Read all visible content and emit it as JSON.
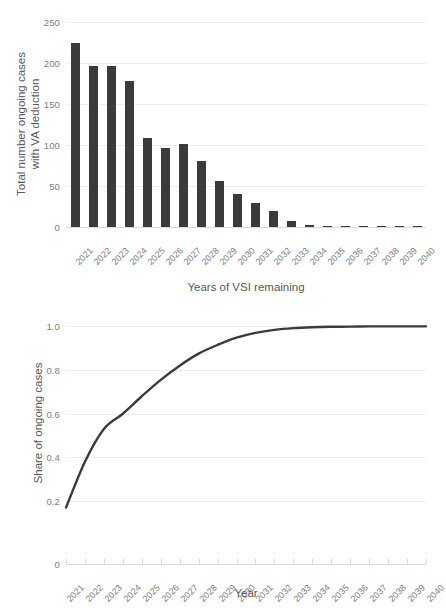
{
  "chart_data": [
    {
      "type": "bar",
      "id": "ongoing-cases-bar",
      "title": "",
      "xlabel": "Years of VSI remaining",
      "ylabel": "Total number ongoing cases with VA deduction",
      "ylabel_lines": [
        "Total number ongoing cases",
        "with VA deduction"
      ],
      "categories": [
        "2021",
        "2022",
        "2023",
        "2024",
        "2025",
        "2026",
        "2027",
        "2028",
        "2029",
        "2030",
        "2031",
        "2032",
        "2033",
        "2034",
        "2035",
        "2036",
        "2037",
        "2038",
        "2039",
        "2040"
      ],
      "values": [
        225,
        196,
        196,
        178,
        109,
        96,
        101,
        80,
        56,
        40,
        29,
        20,
        7,
        3,
        1.5,
        0.6,
        0.6,
        0.6,
        0.6,
        0.6
      ],
      "ylim": [
        0,
        250
      ],
      "yticks": [
        0,
        50,
        100,
        150,
        200,
        250
      ],
      "ytick_labels": [
        "0",
        "50",
        "100",
        "150",
        "200",
        "250"
      ],
      "grid": true,
      "legend": "none",
      "bar_color": "#3b3b3d"
    },
    {
      "type": "line",
      "id": "share-ongoing-cases-line",
      "title": "",
      "xlabel": "Year",
      "ylabel": "Share of ongoing cases",
      "x": [
        "2021",
        "2022",
        "2023",
        "2024",
        "2025",
        "2026",
        "2027",
        "2028",
        "2029",
        "2030",
        "2031",
        "2032",
        "2033",
        "2034",
        "2035",
        "2036",
        "2037",
        "2038",
        "2039",
        "2040"
      ],
      "values": [
        0.17,
        0.38,
        0.53,
        0.6,
        0.68,
        0.755,
        0.82,
        0.875,
        0.915,
        0.948,
        0.97,
        0.984,
        0.992,
        0.996,
        0.998,
        0.999,
        1.0,
        1.0,
        1.0,
        1.0
      ],
      "ylim": [
        0.15,
        1.02
      ],
      "yticks": [
        0.2,
        0.4,
        0.6,
        0.8,
        1.0
      ],
      "ytick_labels": [
        "0.2",
        "0.4",
        "0.6",
        "0.8",
        "1.0"
      ],
      "axis_break_label": "0",
      "grid": true,
      "legend": "none",
      "line_color": "#3b3b3d"
    }
  ],
  "colors": {
    "bar": "#3b3b3d",
    "line": "#3b3b3d",
    "grid": "#ededf0",
    "axis": "#d9d9dd",
    "tick_text": "#7d7d80",
    "title_text": "#58585a",
    "background": "#ffffff"
  }
}
